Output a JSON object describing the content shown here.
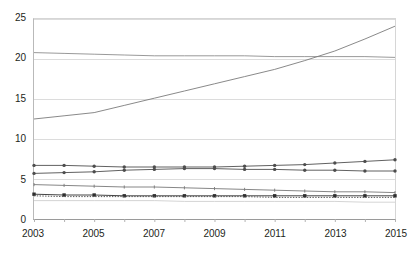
{
  "chart_data": {
    "type": "line",
    "title": "",
    "subtitle": "",
    "xlabel": "",
    "ylabel": "",
    "xlim": [
      2003,
      2015
    ],
    "ylim": [
      0,
      25
    ],
    "grid": true,
    "legend_position": "none",
    "x": [
      2003,
      2004,
      2005,
      2006,
      2007,
      2008,
      2009,
      2010,
      2011,
      2012,
      2013,
      2014,
      2015
    ],
    "xticks": [
      2003,
      2004,
      2005,
      2006,
      2007,
      2008,
      2009,
      2010,
      2011,
      2012,
      2013,
      2014,
      2015
    ],
    "xtick_labels": [
      "2003",
      "",
      "2005",
      "",
      "2007",
      "",
      "2009",
      "",
      "2011",
      "",
      "2013",
      "",
      "2015"
    ],
    "yticks": [
      0,
      5,
      10,
      15,
      20,
      25
    ],
    "ytick_labels": [
      "0",
      "5",
      "10",
      "15",
      "20",
      "25"
    ],
    "series": [
      {
        "name": "series-1-flat-high",
        "color": "#8c8c8c",
        "style": "solid",
        "markers": "none",
        "values": [
          20.8,
          20.7,
          20.6,
          20.5,
          20.4,
          20.4,
          20.4,
          20.4,
          20.3,
          20.3,
          20.3,
          20.3,
          20.2
        ]
      },
      {
        "name": "series-2-rising-steep",
        "color": "#7a7a7a",
        "style": "solid",
        "markers": "none",
        "values": [
          12.5,
          12.9,
          13.3,
          14.2,
          15.1,
          16.0,
          16.9,
          17.8,
          18.7,
          19.8,
          21.0,
          22.5,
          24.1
        ]
      },
      {
        "name": "series-3-mid-rising",
        "color": "#4d4d4d",
        "style": "solid",
        "markers": "dot",
        "values": [
          6.7,
          6.7,
          6.6,
          6.5,
          6.5,
          6.5,
          6.5,
          6.6,
          6.7,
          6.8,
          7.0,
          7.2,
          7.4
        ]
      },
      {
        "name": "series-4-mid-flat",
        "color": "#4d4d4d",
        "style": "solid",
        "markers": "dot",
        "values": [
          5.7,
          5.8,
          5.9,
          6.1,
          6.2,
          6.3,
          6.3,
          6.2,
          6.2,
          6.1,
          6.1,
          6.0,
          6.0
        ]
      },
      {
        "name": "series-5-low-declining",
        "color": "#777777",
        "style": "solid",
        "markers": "tick",
        "values": [
          4.3,
          4.2,
          4.1,
          4.0,
          4.0,
          3.9,
          3.8,
          3.7,
          3.6,
          3.5,
          3.4,
          3.4,
          3.3
        ]
      },
      {
        "name": "series-6-low-flat",
        "color": "#2e2e2e",
        "style": "solid",
        "markers": "square",
        "values": [
          3.1,
          3.0,
          3.0,
          2.9,
          2.9,
          2.9,
          2.9,
          2.9,
          2.9,
          2.9,
          2.9,
          2.9,
          2.9
        ]
      },
      {
        "name": "series-7-dotted",
        "color": "#555555",
        "style": "dotted",
        "markers": "none",
        "values": [
          2.9,
          2.8,
          2.8,
          2.8,
          2.8,
          2.8,
          2.8,
          2.8,
          2.7,
          2.7,
          2.7,
          2.7,
          2.7
        ]
      },
      {
        "name": "series-8-faint-lowest",
        "color": "#cfcfcf",
        "style": "solid",
        "markers": "none",
        "values": [
          2.3,
          2.3,
          2.3,
          2.3,
          2.3,
          2.2,
          2.2,
          2.2,
          2.2,
          2.2,
          2.2,
          2.1,
          2.1
        ]
      }
    ]
  },
  "axis": {
    "grid_color": "#dcdcdc",
    "axis_color": "#9a9a9a",
    "tick_color": "#b0b0b0",
    "label_color": "#231f20"
  }
}
